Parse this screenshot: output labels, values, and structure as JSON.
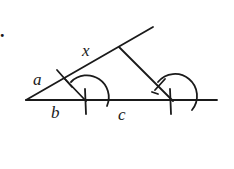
{
  "figure": {
    "marker": ".",
    "labels": {
      "a": "a",
      "x": "x",
      "b": "b",
      "c": "c"
    },
    "colors": {
      "stroke": "#1a1a1a",
      "background": "#ffffff"
    }
  }
}
